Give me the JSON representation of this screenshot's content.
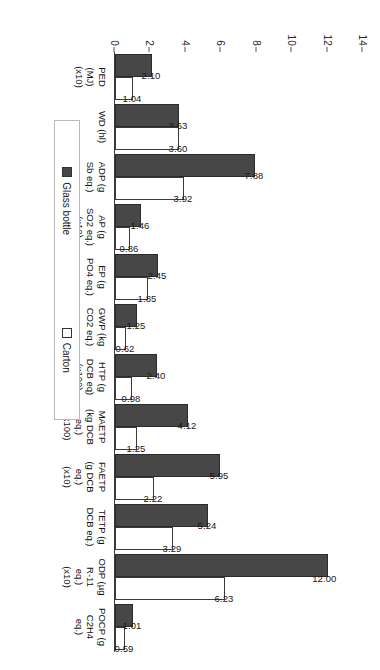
{
  "legend": {
    "items": [
      {
        "label": "Glass bottle",
        "swatch": "filled-square-icon",
        "color": "#474747"
      },
      {
        "label": "Carton",
        "swatch": "empty-square-icon",
        "color": "#ffffff"
      }
    ]
  },
  "axis": {
    "yticks": [
      "0",
      "2",
      "4",
      "6",
      "8",
      "10",
      "12",
      "14"
    ]
  },
  "chart_data": {
    "type": "bar",
    "title": "",
    "xlabel": "",
    "ylabel": "",
    "ylim": [
      0,
      14
    ],
    "grid": false,
    "legend_position": "top-center",
    "categories": [
      "PED\n(MJ)\n(x10)",
      "WD (hl)",
      "ADP (g\nSb eq.)",
      "AP (g\nSO2 eq.)\n(x10)",
      "EP (g\nPO4 eq.)",
      "GWP (kg\nCO2 eq.)",
      "HTP (g\nDCB eq)\n(x100)",
      "MAETP\n(kg DCB\neq.)\n(x100)",
      "FAETP\n(g DCB\neq.)\n(x10)",
      "TETP (g\nDCB eq.)",
      "ODP (µg\nR-11\neq.)\n(x10)",
      "POCP (g\nC2H4\neq.)"
    ],
    "series": [
      {
        "name": "Glass bottle",
        "color": "#474747",
        "values": [
          2.1,
          3.63,
          7.88,
          1.46,
          2.45,
          1.25,
          2.4,
          4.12,
          5.95,
          5.24,
          12.0,
          1.01
        ],
        "labels": [
          "2.10",
          "3.63",
          "7.88",
          "1.46",
          "2.45",
          "1.25",
          "2.40",
          "4.12",
          "5.95",
          "5.24",
          "12.00",
          "1.01"
        ]
      },
      {
        "name": "Carton",
        "color": "#ffffff",
        "values": [
          1.04,
          3.6,
          3.92,
          0.86,
          1.85,
          0.62,
          0.98,
          1.25,
          2.22,
          3.29,
          6.23,
          0.59
        ],
        "labels": [
          "1.04",
          "3.60",
          "3.92",
          "0.86",
          "1.85",
          "0.62",
          "0.98",
          "1.25",
          "2.22",
          "3.29",
          "6.23",
          "0.59"
        ]
      }
    ]
  }
}
